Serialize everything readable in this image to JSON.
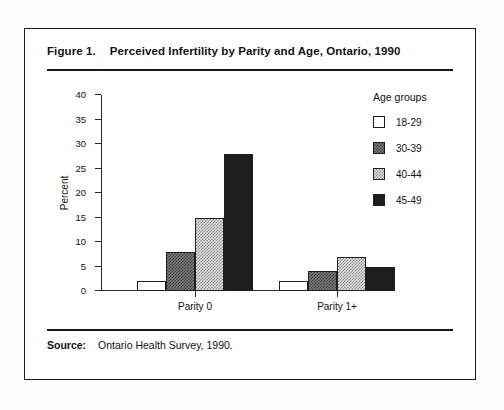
{
  "figure": {
    "number": "Figure 1.",
    "title": "Perceived Infertility by Parity and Age, Ontario, 1990",
    "source_label": "Source:",
    "source_text": "Ontario Health Survey, 1990."
  },
  "legend": {
    "title": "Age groups",
    "entries": [
      {
        "label": "18-29",
        "swatch": "white-open"
      },
      {
        "label": "30-39",
        "swatch": "dark-checker"
      },
      {
        "label": "40-44",
        "swatch": "light-checker"
      },
      {
        "label": "45-49",
        "swatch": "solid-black"
      }
    ]
  },
  "axes": {
    "ylabel": "Percent",
    "yticks": [
      0,
      5,
      10,
      15,
      20,
      25,
      30,
      35,
      40
    ],
    "ymin": 0,
    "ymax": 40,
    "xcategories": [
      "Parity 0",
      "Parity 1+"
    ]
  },
  "chart_data": {
    "type": "bar",
    "title": "Perceived Infertility by Parity and Age, Ontario, 1990",
    "xlabel": "",
    "ylabel": "Percent",
    "ylim": [
      0,
      40
    ],
    "ytick_step": 5,
    "grid": false,
    "legend_title": "Age groups",
    "legend_position": "right",
    "categories": [
      "Parity 0",
      "Parity 1+"
    ],
    "series": [
      {
        "name": "18-29",
        "values": [
          2,
          2
        ],
        "fill": "white-open"
      },
      {
        "name": "30-39",
        "values": [
          8,
          4
        ],
        "fill": "dark-checker"
      },
      {
        "name": "40-44",
        "values": [
          15,
          7
        ],
        "fill": "light-checker"
      },
      {
        "name": "45-49",
        "values": [
          28,
          5
        ],
        "fill": "solid-black"
      }
    ],
    "source": "Ontario Health Survey, 1990."
  }
}
